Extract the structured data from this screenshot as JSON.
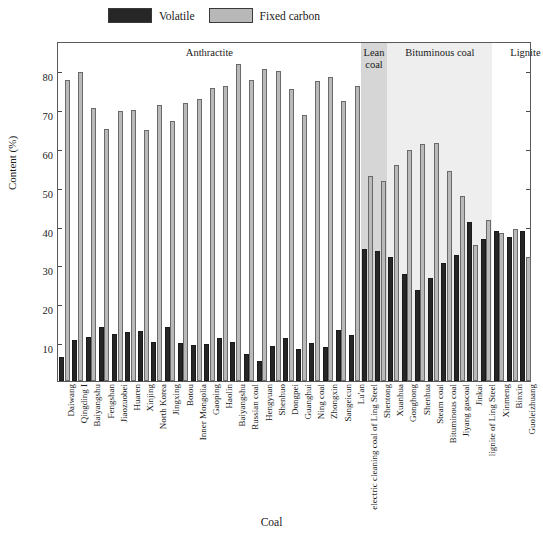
{
  "legend": {
    "items": [
      {
        "label": "Volatile",
        "color": "#262626",
        "name": "volatile"
      },
      {
        "label": "Fixed carbon",
        "color": "#b9b9b9",
        "name": "fixed-carbon"
      }
    ]
  },
  "axes": {
    "ylabel": "Content (%)",
    "xlabel": "Coal",
    "yticks": [
      10,
      20,
      30,
      40,
      50,
      60,
      70,
      80
    ],
    "ylim": [
      0,
      87.5
    ]
  },
  "groups": [
    {
      "label": "Anthractite",
      "start": 0,
      "end": 23,
      "shade": "none"
    },
    {
      "label": "Lean\ncoal",
      "start": 23,
      "end": 25,
      "shade": "dark"
    },
    {
      "label": "Bituminous coal",
      "start": 25,
      "end": 33,
      "shade": "light"
    },
    {
      "label": "Lignite",
      "start": 33,
      "end": 38,
      "shade": "none"
    }
  ],
  "chart_data": {
    "type": "bar",
    "title": "",
    "xlabel": "Coal",
    "ylabel": "Content (%)",
    "ylim": [
      0,
      87.5
    ],
    "grid": false,
    "legend_position": "top",
    "categories": [
      "Daiwang",
      "Qingding I",
      "Baiyangshu",
      "Fengshan",
      "Jiaozuobei",
      "Huaren",
      "Xinjing",
      "North Korea",
      "Jingxing",
      "Botou",
      "Inner Mongolia",
      "Gaoping",
      "Haolin",
      "Baiyangshu",
      "Russian coal",
      "Hengyuan",
      "Shenhuo",
      "Dongpei",
      "Guanghui",
      "Ning coal",
      "Zhongxin",
      "Sangeicun",
      "Lu'an",
      "electric cleaning coal of Ling Steel",
      "Shentong",
      "Xuanhua",
      "Gonghong",
      "Shenhua",
      "Steam coal",
      "Bituminous coal",
      "Jiyang gascoal",
      "Jinkai",
      "lignite of Ling Steel",
      "Xinmeng",
      "Binxin",
      "Guoleizhuang"
    ],
    "series": [
      {
        "name": "Volatile",
        "color": "#262626",
        "values": [
          6.2,
          10.5,
          11.2,
          14.0,
          12.2,
          12.5,
          12.8,
          10.0,
          13.8,
          9.8,
          9.2,
          9.5,
          11.0,
          10.0,
          7.0,
          5.2,
          9.0,
          11.0,
          8.2,
          9.8,
          8.8,
          13.2,
          11.8,
          34.0,
          33.5,
          32.0,
          27.5,
          23.5,
          26.5,
          30.5,
          32.5,
          41.0,
          36.5,
          38.5,
          37.0,
          38.5
        ]
      },
      {
        "name": "Fixed carbon",
        "color": "#b9b9b9",
        "values": [
          77.5,
          79.5,
          70.2,
          64.8,
          69.5,
          69.8,
          64.5,
          71.0,
          67.0,
          71.5,
          72.5,
          75.5,
          76.0,
          81.5,
          77.5,
          80.2,
          79.8,
          75.2,
          68.5,
          77.2,
          78.2,
          72.0,
          76.0,
          52.8,
          51.5,
          55.5,
          59.5,
          61.0,
          61.2,
          54.0,
          47.5,
          35.0,
          41.5,
          38.0,
          39.0,
          32.0
        ]
      }
    ]
  }
}
